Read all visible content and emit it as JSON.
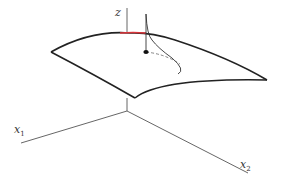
{
  "figure": {
    "type": "3d-surface-diagram",
    "colors": {
      "axis": "#555555",
      "surface_edge": "#222222",
      "highlight_edge": "#d9343a",
      "curve": "#333333",
      "dashed": "#666666",
      "point": "#111111"
    },
    "labels": {
      "z_axis": "z",
      "x1_axis_base": "x",
      "x1_axis_sub": "1",
      "x2_axis_base": "x",
      "x2_axis_sub": "2"
    }
  }
}
